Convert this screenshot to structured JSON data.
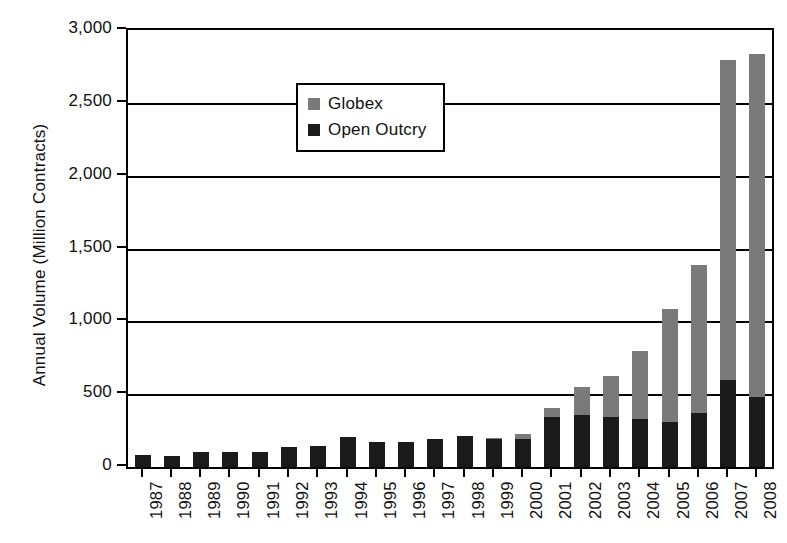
{
  "chart_data": {
    "type": "bar",
    "subtype": "stacked",
    "title": "",
    "xlabel": "",
    "ylabel": "Annual Volume (Million Contracts)",
    "ylim": [
      0,
      3000
    ],
    "ytick_values": [
      0,
      500,
      1000,
      1500,
      2000,
      2500,
      3000
    ],
    "ytick_labels": [
      "0",
      "500",
      "1,000",
      "1,500",
      "2,000",
      "2,500",
      "3,000"
    ],
    "grid": true,
    "grid_axis": "y",
    "legend_position": "upper-left-inside",
    "categories": [
      "1987",
      "1988",
      "1989",
      "1990",
      "1991",
      "1992",
      "1993",
      "1994",
      "1995",
      "1996",
      "1997",
      "1998",
      "1999",
      "2000",
      "2001",
      "2002",
      "2003",
      "2004",
      "2005",
      "2006",
      "2007",
      "2008"
    ],
    "series": [
      {
        "name": "Open Outcry",
        "color": "#1b1b1b",
        "values": [
          80,
          75,
          105,
          100,
          105,
          135,
          145,
          205,
          175,
          170,
          195,
          210,
          190,
          195,
          340,
          355,
          345,
          330,
          310,
          370,
          600,
          480
        ]
      },
      {
        "name": "Globex",
        "color": "#7a7a7a",
        "values": [
          0,
          0,
          0,
          0,
          0,
          0,
          0,
          0,
          0,
          0,
          0,
          5,
          10,
          35,
          65,
          195,
          280,
          465,
          775,
          1020,
          2195,
          2355
        ]
      }
    ],
    "totals": [
      80,
      75,
      105,
      100,
      105,
      135,
      145,
      205,
      175,
      170,
      195,
      215,
      200,
      230,
      405,
      550,
      625,
      795,
      1085,
      1390,
      2795,
      2835
    ]
  },
  "legend": {
    "items": [
      {
        "label": "Globex",
        "color": "#7a7a7a"
      },
      {
        "label": "Open Outcry",
        "color": "#1b1b1b"
      }
    ]
  }
}
